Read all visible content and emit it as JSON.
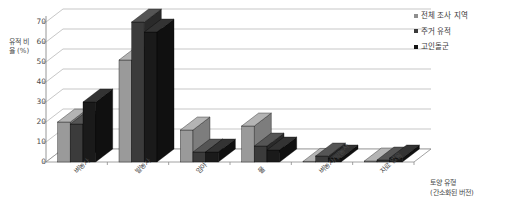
{
  "chart_data": {
    "type": "bar",
    "title": "",
    "subtitle": "",
    "xlabel": "토양 유형\n(간소화된 버전)",
    "xlabel_line1": "토양 유형",
    "xlabel_line2": "(간소화된 버전)",
    "ylabel": "유적 비율 (%)",
    "ylim": [
      0,
      70
    ],
    "ytick_values": [
      0,
      10,
      20,
      30,
      40,
      50,
      60,
      70
    ],
    "ytick_labels": [
      "0",
      "10",
      "20",
      "30",
      "40",
      "50",
      "60",
      "70"
    ],
    "grid": true,
    "grid_axis": "y",
    "legend_position": "right",
    "three_d": true,
    "categories": [
      "벼농사",
      "밭농사",
      "임야",
      "물",
      "벼농사/밭농사",
      "자료 없음"
    ],
    "series": [
      {
        "name": "전체 조사 지역",
        "color": "#9a9a9a",
        "side_color": "#7d7d7d",
        "top_color": "#b4b4b4",
        "values": [
          20,
          51,
          16,
          18,
          0.3,
          0.5
        ]
      },
      {
        "name": "주거 유적",
        "color": "#3b3b3b",
        "side_color": "#2a2a2a",
        "top_color": "#555555",
        "values": [
          19,
          70,
          5,
          8,
          3,
          1
        ]
      },
      {
        "name": "고인돌군",
        "color": "#1a1a1a",
        "side_color": "#101010",
        "top_color": "#333333",
        "values": [
          30,
          65,
          5,
          6,
          2,
          2
        ]
      }
    ]
  },
  "axis": {
    "y_title": "유적 비율 (%)",
    "x_title_line1": "토양 유형",
    "x_title_line2": "(간소화된 버전)"
  },
  "legend": {
    "items": [
      {
        "label": "전체 조사 지역",
        "color": "#8f8f8f"
      },
      {
        "label": "주거 유적",
        "color": "#3b3b3b"
      },
      {
        "label": "고인돌군",
        "color": "#141414"
      }
    ]
  },
  "colors": {
    "background": "#ffffff",
    "gridline": "#b9b9b9",
    "axis": "#8a8a8a",
    "text": "#3a3a3a"
  }
}
